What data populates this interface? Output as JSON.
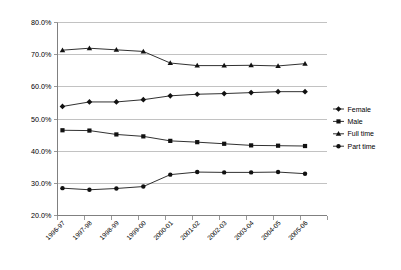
{
  "chart_data": {
    "type": "line",
    "title": "",
    "subtitle": "",
    "xlabel": "",
    "ylabel": "",
    "categories": [
      "1996-97",
      "1997-98",
      "1998-99",
      "1999-00",
      "2000-01",
      "2001-02",
      "2002-03",
      "2003-04",
      "2004-05",
      "2005-06"
    ],
    "ylim": [
      20.0,
      80.0
    ],
    "ytick_labels": [
      "80.0%",
      "70.0%",
      "60.0%",
      "50.0%",
      "40.0%",
      "30.0%",
      "20.0%"
    ],
    "ytick_values": [
      80.0,
      70.0,
      60.0,
      50.0,
      40.0,
      30.0,
      20.0
    ],
    "grid": true,
    "legend_position": "right",
    "series": [
      {
        "name": "Female",
        "marker": "diamond",
        "color": "#111111",
        "values": [
          53.9,
          55.3,
          55.3,
          56.0,
          57.2,
          57.7,
          57.9,
          58.2,
          58.5,
          58.5
        ]
      },
      {
        "name": "Male",
        "marker": "square",
        "color": "#111111",
        "values": [
          46.5,
          46.4,
          45.2,
          44.6,
          43.2,
          42.8,
          42.3,
          41.8,
          41.7,
          41.6
        ]
      },
      {
        "name": "Full time",
        "marker": "triangle",
        "color": "#111111",
        "values": [
          71.4,
          72.0,
          71.5,
          71.0,
          67.4,
          66.6,
          66.6,
          66.7,
          66.5,
          67.2
        ]
      },
      {
        "name": "Part time",
        "marker": "circle",
        "color": "#111111",
        "values": [
          28.5,
          28.0,
          28.4,
          29.0,
          32.7,
          33.5,
          33.4,
          33.4,
          33.5,
          33.0
        ]
      }
    ]
  },
  "legend": {
    "items": [
      {
        "label": "Female",
        "marker": "diamond"
      },
      {
        "label": "Male",
        "marker": "square"
      },
      {
        "label": "Full time",
        "marker": "triangle"
      },
      {
        "label": "Part time",
        "marker": "circle"
      }
    ]
  },
  "colors": {
    "series": "#111111",
    "gridline": "#b3b3b3",
    "axis": "#808080",
    "background": "#ffffff"
  }
}
